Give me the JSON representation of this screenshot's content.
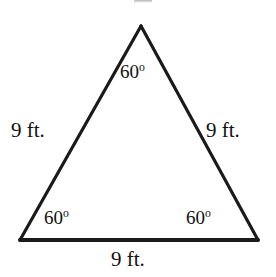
{
  "figure": {
    "background_color": "#ffffff",
    "stroke_color": "#1a1a1a"
  },
  "shape": {
    "name": "triangle",
    "type": "equilateral",
    "vertices": {
      "apex": {
        "x": 141,
        "y": 26
      },
      "bottom_left": {
        "x": 20,
        "y": 240
      },
      "bottom_right": {
        "x": 258,
        "y": 240
      }
    },
    "stroke_width_sides": 3.2,
    "stroke_width_base": 4
  },
  "labels": {
    "side_left": "9 ft.",
    "side_right": "9 ft.",
    "side_bottom": "9 ft.",
    "angle_top_value": "60",
    "angle_top_unit": "o",
    "angle_bottom_left_value": "60",
    "angle_bottom_left_unit": "o",
    "angle_bottom_right_value": "60",
    "angle_bottom_right_unit": "o"
  }
}
